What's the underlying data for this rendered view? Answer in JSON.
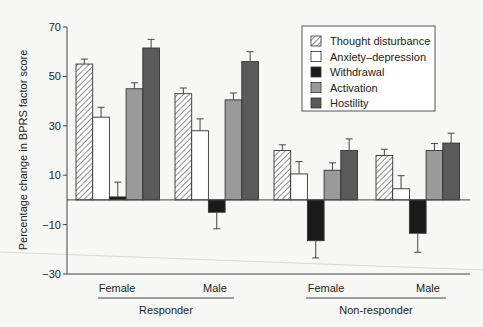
{
  "chart_data": {
    "type": "bar",
    "title": "",
    "xlabel": "",
    "ylabel": "Percentage change in BPRS  factor score",
    "ylim": [
      -30,
      70
    ],
    "yticks": [
      70,
      50,
      30,
      10,
      -10,
      -30
    ],
    "grid": false,
    "legend_position": "upper right",
    "categories": [
      "Female",
      "Male",
      "Female",
      "Male"
    ],
    "groups": [
      {
        "label": "Responder",
        "categories": [
          "Female",
          "Male"
        ]
      },
      {
        "label": "Non-responder",
        "categories": [
          "Female",
          "Male"
        ]
      }
    ],
    "series": [
      {
        "name": "Thought disturbance",
        "fill": "hatch",
        "color": "#ffffff",
        "values": [
          55,
          43,
          20,
          18
        ],
        "errors": [
          2,
          2.3,
          2.3,
          2.5
        ]
      },
      {
        "name": "Anxiety–depression",
        "fill": "solid",
        "color": "#ffffff",
        "values": [
          33.5,
          28,
          10.5,
          4.5
        ],
        "errors": [
          4,
          4.8,
          5,
          5.3
        ]
      },
      {
        "name": "Withdrawal",
        "fill": "solid",
        "color": "#1a1a1a",
        "values": [
          1.2,
          -5,
          -16.5,
          -13.5
        ],
        "errors": [
          6,
          6.7,
          7,
          7.7
        ]
      },
      {
        "name": "Activation",
        "fill": "solid",
        "color": "#9a9a9a",
        "values": [
          45,
          40.5,
          12,
          20
        ],
        "errors": [
          2.4,
          2.8,
          3,
          2.8
        ]
      },
      {
        "name": "Hostility",
        "fill": "solid",
        "color": "#5a5a5a",
        "values": [
          61.5,
          56,
          20,
          23
        ],
        "errors": [
          3.5,
          4,
          4.7,
          4
        ]
      }
    ]
  }
}
